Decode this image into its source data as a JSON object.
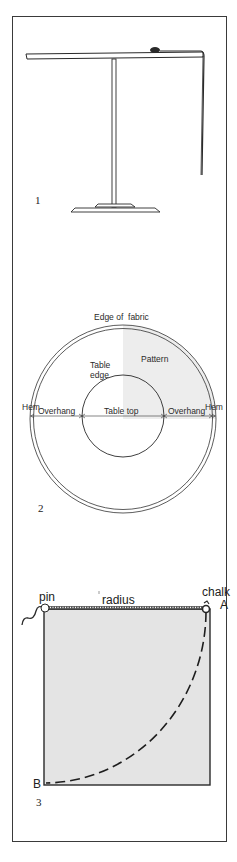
{
  "figures": [
    {
      "number": "1",
      "description": "Side view of round pedestal table with tape measure hanging from edge"
    },
    {
      "number": "2",
      "labels": {
        "edge_of_fabric": "Edge of  fabric",
        "pattern": "Pattern",
        "table_edge_line1": "Table",
        "table_edge_line2": "edge",
        "hem_left": "Hem",
        "overhang_left": "Overhang",
        "table_top": "Table top",
        "overhang_right": "Overhang",
        "hem_right": "Hem"
      }
    },
    {
      "number": "3",
      "labels": {
        "pin": "pin",
        "radius": "radius",
        "chalk": "chalk",
        "point_a": "A",
        "point_b": "B"
      }
    }
  ],
  "colors": {
    "line": "#2a2a2a",
    "pattern_fill": "#ededed",
    "square_fill": "#e4e4e4",
    "frame": "#3a3a3a"
  }
}
